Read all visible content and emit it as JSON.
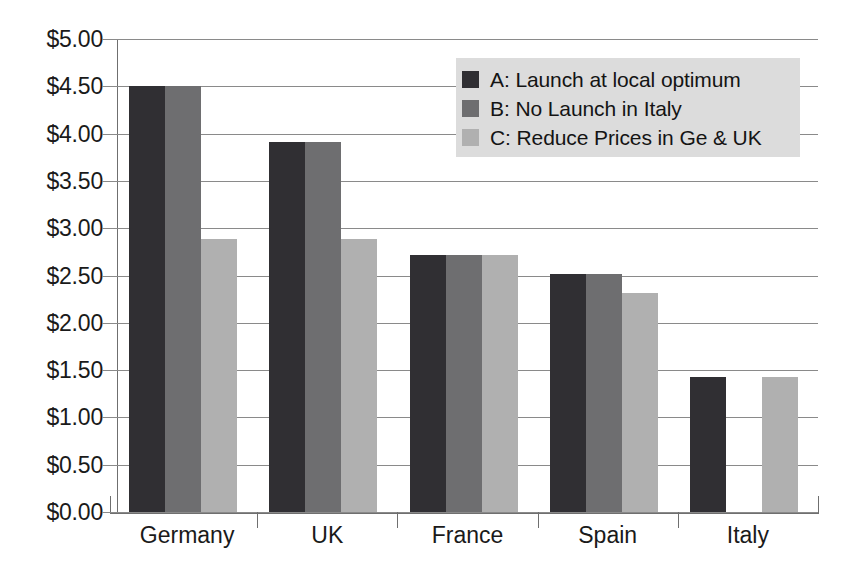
{
  "chart_data": {
    "type": "bar",
    "title": "",
    "subtitle": "",
    "xlabel": "",
    "ylabel": "",
    "categories": [
      "Germany",
      "UK",
      "France",
      "Spain",
      "Italy"
    ],
    "series": [
      {
        "name": "A: Launch at local optimum",
        "key": "A",
        "color": "#302f33",
        "values": [
          4.5,
          3.91,
          2.72,
          2.52,
          1.43
        ]
      },
      {
        "name": "B: No Launch in Italy",
        "key": "B",
        "color": "#6e6e70",
        "values": [
          4.5,
          3.91,
          2.72,
          2.52,
          0.0
        ]
      },
      {
        "name": "C: Reduce Prices in Ge & UK",
        "key": "C",
        "color": "#b0b0b0",
        "values": [
          2.89,
          2.89,
          2.72,
          2.32,
          1.43
        ]
      }
    ],
    "ylim": [
      0,
      5
    ],
    "ytick_values": [
      0,
      0.5,
      1,
      1.5,
      2,
      2.5,
      3,
      3.5,
      4,
      4.5,
      5
    ],
    "ytick_labels": [
      "$0.00",
      "$0.50",
      "$1.00",
      "$1.50",
      "$2.00",
      "$2.50",
      "$3.00",
      "$3.50",
      "$4.00",
      "$4.50",
      "$5.00"
    ],
    "grid": true,
    "grid_axis": "y",
    "legend_position": "top-right",
    "gridline_color": "#8a8a8a",
    "axis_color": "#6f6f6f",
    "plot_background": "#ffffff",
    "legend_background": "#dcdcdc",
    "text_color": "#1a1a1a"
  },
  "legend": {
    "entries": [
      {
        "label": "A: Launch at local optimum"
      },
      {
        "label": "B: No Launch in Italy"
      },
      {
        "label": "C: Reduce Prices in Ge & UK"
      }
    ]
  }
}
